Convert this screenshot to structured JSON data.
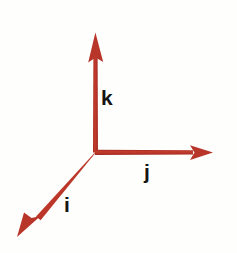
{
  "diagram": {
    "background_color": "#fefefc",
    "vector_color": "#b8352a",
    "label_color": "#161412",
    "origin": {
      "x": 96,
      "y": 152
    },
    "canvas": {
      "width": 237,
      "height": 253
    },
    "axes": [
      {
        "id": "k",
        "label": "k",
        "name": "k-axis-vector",
        "description": "vertical unit vector pointing up",
        "from": {
          "x": 96,
          "y": 152
        },
        "to": {
          "x": 95,
          "y": 33
        },
        "label_position": {
          "x": 101,
          "y": 87
        },
        "shaft_width": 5,
        "arrow_length": 26,
        "arrow_half_width": 8
      },
      {
        "id": "j",
        "label": "j",
        "name": "j-axis-vector",
        "description": "horizontal unit vector pointing right",
        "from": {
          "x": 96,
          "y": 152
        },
        "to": {
          "x": 213,
          "y": 152
        },
        "label_position": {
          "x": 144,
          "y": 161
        },
        "shaft_width": 5,
        "arrow_length": 24,
        "arrow_half_width": 8
      },
      {
        "id": "i",
        "label": "i",
        "name": "i-axis-vector",
        "description": "oblique unit vector pointing toward lower left",
        "from": {
          "x": 96,
          "y": 152
        },
        "to": {
          "x": 17,
          "y": 237
        },
        "label_position": {
          "x": 64,
          "y": 194
        },
        "shaft_width": 5,
        "arrow_length": 26,
        "arrow_half_width": 8
      }
    ]
  }
}
